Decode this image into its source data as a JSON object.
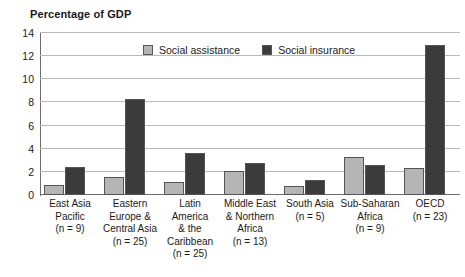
{
  "chart_data": {
    "type": "bar",
    "title": "Percentage of GDP",
    "xlabel": "",
    "ylabel": "",
    "ylim": [
      0,
      14
    ],
    "yticks": [
      0,
      2,
      4,
      6,
      8,
      10,
      12,
      14
    ],
    "grid": "horizontal",
    "legend_position": "top-center",
    "categories": [
      "East Asia Pacific (n = 9)",
      "Eastern Europe & Central Asia (n = 25)",
      "Latin America & the Caribbean (n = 25)",
      "Middle East & Northern Africa (n = 13)",
      "South Asia (n = 5)",
      "Sub-Saharan Africa (n = 9)",
      "OECD (n = 23)"
    ],
    "category_lines": [
      [
        "East Asia",
        "Pacific",
        "(n = 9)"
      ],
      [
        "Eastern",
        "Europe &",
        "Central Asia",
        "(n = 25)"
      ],
      [
        "Latin",
        "America",
        "& the",
        "Caribbean",
        "(n = 25)"
      ],
      [
        "Middle East",
        "& Northern",
        "Africa",
        "(n = 13)"
      ],
      [
        "South Asia",
        "(n = 5)"
      ],
      [
        "Sub-Saharan",
        "Africa",
        "(n = 9)"
      ],
      [
        "OECD",
        "(n = 23)"
      ]
    ],
    "series": [
      {
        "name": "Social assistance",
        "color": "#b5b5b5",
        "values": [
          0.9,
          1.6,
          1.1,
          2.1,
          0.8,
          3.3,
          2.3
        ]
      },
      {
        "name": "Social insurance",
        "color": "#3b3b3b",
        "values": [
          2.4,
          8.3,
          3.6,
          2.8,
          1.3,
          2.6,
          13.0
        ]
      }
    ]
  },
  "colors": {
    "assistance": "#b5b5b5",
    "insurance": "#3b3b3b",
    "gridline": "#b9b9b9",
    "axis": "#6d6d6d",
    "text": "#1a1a1a"
  }
}
